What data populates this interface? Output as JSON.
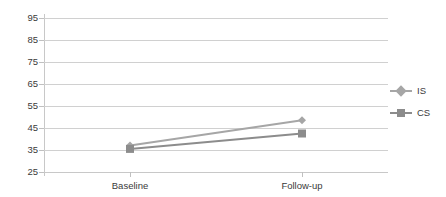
{
  "chart_data": {
    "type": "line",
    "title": "",
    "xlabel": "",
    "ylabel": "",
    "categories": [
      "Baseline",
      "Follow-up"
    ],
    "series": [
      {
        "name": "IS",
        "values": [
          37,
          48.5
        ],
        "color": "#a6a6a6",
        "marker": "diamond"
      },
      {
        "name": "CS",
        "values": [
          35.5,
          42.5
        ],
        "color": "#8c8c8c",
        "marker": "square"
      }
    ],
    "ylim": [
      25,
      95
    ],
    "ytick_step": 10,
    "yticks": [
      95,
      85,
      75,
      65,
      55,
      45,
      35,
      25
    ],
    "ytick_labels": [
      "95",
      "85",
      "75",
      "65",
      "55",
      "45",
      "35",
      "25"
    ],
    "grid": true,
    "grid_axis": "y",
    "legend_position": "right",
    "legend": [
      "IS",
      "CS"
    ]
  },
  "colors": {
    "grid": "#d0d0d0",
    "axis": "#c8c8c8",
    "text": "#3a3a3a",
    "series_is": "#a6a6a6",
    "series_cs": "#8c8c8c",
    "background": "#ffffff"
  }
}
